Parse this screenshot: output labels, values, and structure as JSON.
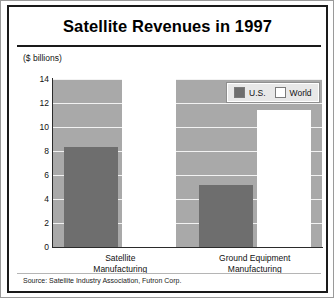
{
  "figure": {
    "title": "Satellite Revenues in 1997",
    "source": "Source: Satellite Industry Association, Futron Corp."
  },
  "chart_data": {
    "type": "bar",
    "title": "Satellite Revenues in 1997",
    "subtitle": "",
    "xlabel": "",
    "ylabel": "($ billions)",
    "ylim": [
      0,
      14
    ],
    "yticks": [
      0,
      2,
      4,
      6,
      8,
      10,
      12,
      14
    ],
    "ytick_labels": [
      "0",
      "2",
      "4",
      "6",
      "8",
      "10",
      "12",
      "14"
    ],
    "grid": true,
    "grid_axis": "y",
    "legend_position": "top-right",
    "categories": [
      "Satellite Manufacturing",
      "Ground Equipment Manufacturing"
    ],
    "category_lines": [
      [
        "Satellite",
        "Manufacturing"
      ],
      [
        "Ground Equipment",
        "Manufacturing"
      ]
    ],
    "series": [
      {
        "name": "U.S.",
        "color": "#6e6e6e",
        "values": [
          8.3,
          5.2
        ]
      },
      {
        "name": "World",
        "color": "#ffffff",
        "values": [
          14.0,
          11.4
        ]
      }
    ],
    "annotations": [],
    "source": "Source: Satellite Industry Association, Futron Corp."
  },
  "legend": {
    "entries": [
      {
        "label": "U.S.",
        "swatch": "us"
      },
      {
        "label": "World",
        "swatch": "world"
      }
    ]
  },
  "colors": {
    "plot_background": "#a9a9a9",
    "gridline": "#f2f2f2",
    "us_bar": "#6e6e6e",
    "world_bar": "#ffffff",
    "axis": "#2b2b2b",
    "frame": "#1a1a1a",
    "text": "#111111"
  }
}
